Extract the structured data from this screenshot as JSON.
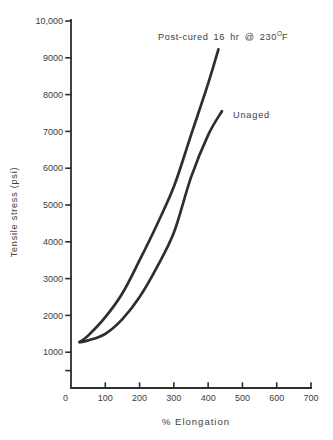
{
  "colors": {
    "ink": "#2e2e2e",
    "text": "#3d3d3d",
    "background": "#ffffff"
  },
  "chart_data": {
    "type": "line",
    "title": "",
    "xlabel": "% Elongation",
    "ylabel": "Tensile stress (psi)",
    "xlim": [
      0,
      700
    ],
    "ylim": [
      0,
      10000
    ],
    "grid": false,
    "legend_position": "inline curve annotations",
    "x_ticks": [
      0,
      100,
      200,
      300,
      400,
      500,
      600,
      700
    ],
    "y_ticks": [
      {
        "value": 500,
        "label": ""
      },
      {
        "value": 1000,
        "label": "1000"
      },
      {
        "value": 2000,
        "label": "2000"
      },
      {
        "value": 3000,
        "label": "3000"
      },
      {
        "value": 4000,
        "label": "4000"
      },
      {
        "value": 5000,
        "label": "5000"
      },
      {
        "value": 6000,
        "label": "6000"
      },
      {
        "value": 7000,
        "label": "7000"
      },
      {
        "value": 8000,
        "label": "8000"
      },
      {
        "value": 9000,
        "label": "9000"
      },
      {
        "value": 10000,
        "label": "10,000"
      }
    ],
    "series": [
      {
        "name": "Post-cured 16 hr @ 230°F",
        "x": [
          25,
          50,
          100,
          150,
          200,
          250,
          300,
          350,
          400,
          430
        ],
        "y": [
          1280,
          1450,
          1950,
          2600,
          3500,
          4450,
          5500,
          6900,
          8300,
          9230
        ]
      },
      {
        "name": "Unaged",
        "x": [
          25,
          50,
          100,
          150,
          200,
          250,
          300,
          350,
          400,
          440
        ],
        "y": [
          1270,
          1320,
          1500,
          1900,
          2500,
          3300,
          4250,
          5750,
          6900,
          7550
        ]
      }
    ]
  },
  "annotations": {
    "post_cured": {
      "prefix": "Post-cured 16 hr @ 230",
      "degree": "O",
      "suffix": "F"
    },
    "unaged": "Unaged"
  }
}
